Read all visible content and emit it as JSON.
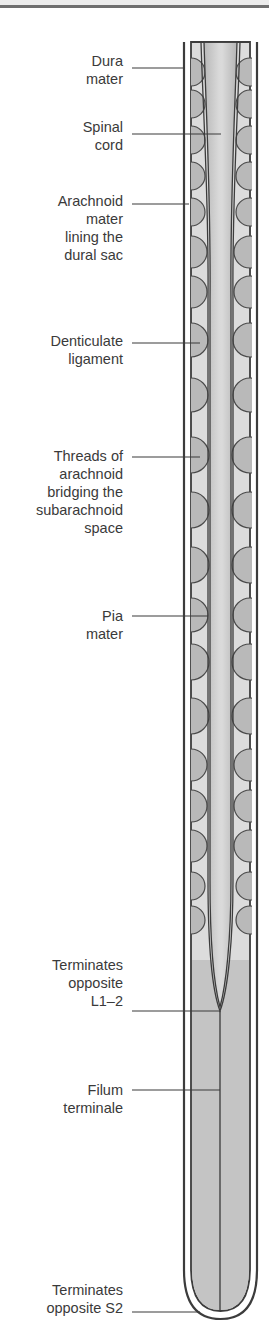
{
  "figure": {
    "type": "anatomical-diagram",
    "colors": {
      "outline": "#3c3c3c",
      "dura_gap": "#ffffff",
      "subarachnoid_space": "#dcdcdc",
      "arachnoid_threads": "#b9b9b9",
      "spinal_cord": "#c9c9c9",
      "cord_highlight": "#dadada",
      "csf_below_cord": "#c4c4c4",
      "leader_line": "#3a3a3a"
    }
  },
  "labels": [
    {
      "id": "dura-mater",
      "lines": [
        "Dura",
        "mater"
      ],
      "top": 52,
      "leader_y": 68,
      "leader_x2": 185
    },
    {
      "id": "spinal-cord",
      "lines": [
        "Spinal",
        "cord"
      ],
      "top": 118,
      "leader_y": 134,
      "leader_x2": 221
    },
    {
      "id": "arachnoid-mater",
      "lines": [
        "Arachnoid",
        "mater",
        "lining the",
        "dural sac"
      ],
      "top": 188,
      "leader_y": 204,
      "leader_x2": 189
    },
    {
      "id": "denticulate-ligament",
      "lines": [
        "Denticulate",
        "ligament"
      ],
      "top": 327,
      "leader_y": 343,
      "leader_x2": 200
    },
    {
      "id": "arachnoid-threads",
      "lines": [
        "Threads of",
        "arachnoid",
        "bridging the",
        "subarachnoid",
        "space"
      ],
      "top": 449,
      "leader_y": 457,
      "leader_x2": 200
    },
    {
      "id": "pia-mater",
      "lines": [
        "Pia",
        "mater"
      ],
      "top": 600,
      "leader_y": 616,
      "leader_x2": 208
    },
    {
      "id": "cord-termination",
      "lines": [
        "Terminates",
        "opposite",
        "L1–2"
      ],
      "top": 952,
      "leader_y": 1011,
      "leader_x2": 220
    },
    {
      "id": "filum-terminale",
      "lines": [
        "Filum",
        "terminale"
      ],
      "top": 1081,
      "leader_y": 1090,
      "leader_x2": 220
    },
    {
      "id": "sac-termination",
      "lines": [
        "Terminates",
        "opposite S2"
      ],
      "top": 1280,
      "leader_y": 1312,
      "leader_x2": 200
    }
  ]
}
